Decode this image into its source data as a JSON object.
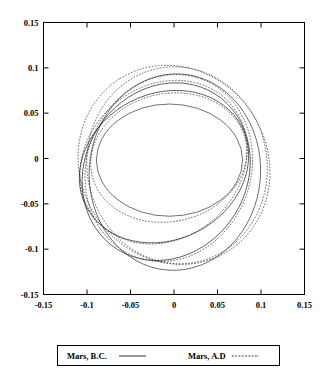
{
  "chart_data": {
    "type": "line",
    "title": "",
    "subtitle": "",
    "xlabel": "",
    "ylabel": "",
    "xlim": [
      -0.15,
      0.15
    ],
    "ylim": [
      -0.15,
      0.15
    ],
    "grid": false,
    "legend_position": "bottom",
    "x_ticks": [
      "-0.15",
      "-0.1",
      "-0.05",
      "0",
      "0.05",
      "0.1",
      "0.15"
    ],
    "x_tick_values": [
      -0.15,
      -0.1,
      -0.05,
      0,
      0.05,
      0.1,
      0.15
    ],
    "y_ticks": [
      "0.15",
      "0.1",
      "0.05",
      "0",
      "-0.05",
      "-0.1",
      "-0.15"
    ],
    "y_tick_values": [
      0.15,
      0.1,
      0.05,
      0,
      -0.05,
      -0.1,
      -0.15
    ],
    "series": [
      {
        "name": "Mars, B.C.",
        "style": "solid",
        "description": "Precessing Mars orbit ellipses, B.C. epochs",
        "ellipses": [
          {
            "cx": -0.0052,
            "cy": -0.0018,
            "rx": 0.084,
            "ry": 0.0645,
            "rotation_deg": 0
          },
          {
            "cx": -0.0115,
            "cy": -0.009,
            "rx": 0.1005,
            "ry": 0.084,
            "rotation_deg": 27
          },
          {
            "cx": -0.009,
            "cy": -0.0145,
            "rx": 0.1055,
            "ry": 0.093,
            "rotation_deg": 58
          },
          {
            "cx": 0.001,
            "cy": -0.015,
            "rx": 0.113,
            "ry": 0.0985,
            "rotation_deg": 86
          }
        ]
      },
      {
        "name": "Mars, A.D",
        "style": "dashed",
        "description": "Precessing Mars orbit ellipses, A.D epochs",
        "ellipses": [
          {
            "cx": -0.006,
            "cy": 0.001,
            "rx": 0.0905,
            "ry": 0.0735,
            "rotation_deg": 13
          },
          {
            "cx": -0.012,
            "cy": -0.004,
            "rx": 0.102,
            "ry": 0.0875,
            "rotation_deg": 41
          },
          {
            "cx": -0.006,
            "cy": -0.0105,
            "rx": 0.109,
            "ry": 0.0945,
            "rotation_deg": 70
          },
          {
            "cx": 0.0035,
            "cy": -0.0075,
            "rx": 0.1135,
            "ry": 0.1035,
            "rotation_deg": 100
          },
          {
            "cx": 0.0,
            "cy": -0.007,
            "rx": 0.117,
            "ry": 0.1075,
            "rotation_deg": 122
          }
        ]
      }
    ],
    "x_extent_observed": [
      -0.124,
      0.121
    ],
    "y_extent_observed": [
      -0.125,
      0.116
    ]
  },
  "legend": {
    "entries": [
      {
        "label": "Mars, B.C.",
        "style": "solid"
      },
      {
        "label": "Mars, A.D",
        "style": "dashed"
      }
    ]
  },
  "colors": {
    "background": "#ffffff",
    "axis": "#000000",
    "curve": "#1a1a1a"
  }
}
